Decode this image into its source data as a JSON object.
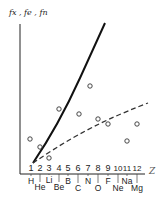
{
  "chart_data": {
    "type": "scatter",
    "title": "",
    "ylabel": "fx, fe, fn",
    "xlabel": "Z",
    "categories": [
      "1",
      "2",
      "3",
      "4",
      "5",
      "6",
      "7",
      "8",
      "9",
      "10",
      "11",
      "12"
    ],
    "elements": [
      "H",
      "He",
      "Li",
      "Be",
      "B",
      "C",
      "N",
      "O",
      "F",
      "Ne",
      "Na",
      "Mg"
    ],
    "x": [
      1,
      2,
      3,
      4,
      5,
      6,
      7,
      8,
      9,
      10,
      11,
      12
    ],
    "series": [
      {
        "name": "measured points",
        "style": "open-circle",
        "x": [
          1,
          2,
          3,
          4,
          6,
          7,
          8,
          9,
          11,
          12
        ],
        "values": [
          0.25,
          0.18,
          0.04,
          0.54,
          0.43,
          0.67,
          0.4,
          0.35,
          0.22,
          0.35
        ]
      },
      {
        "name": "solid curve",
        "style": "solid",
        "x": [
          1,
          3,
          5,
          7,
          8.3
        ],
        "values": [
          0.0,
          0.35,
          0.72,
          1.05,
          1.25
        ]
      },
      {
        "name": "dashed line",
        "style": "dashed",
        "x": [
          1,
          4,
          8,
          12.5
        ],
        "values": [
          0.0,
          0.18,
          0.36,
          0.52
        ]
      }
    ],
    "ylim": [
      0,
      1.3
    ],
    "xlim": [
      0,
      13
    ],
    "grid": false,
    "legend": "none"
  },
  "axis": {
    "y_label": "fx , fe , fn",
    "x_label": "Z",
    "ticks": [
      "1",
      "2",
      "3",
      "4",
      "5",
      "6",
      "7",
      "8",
      "9",
      "10",
      "11",
      "12"
    ],
    "elements": [
      "H",
      "He",
      "Li",
      "Be",
      "B",
      "C",
      "N",
      "O",
      "F",
      "Ne",
      "Na",
      "Mg"
    ]
  }
}
